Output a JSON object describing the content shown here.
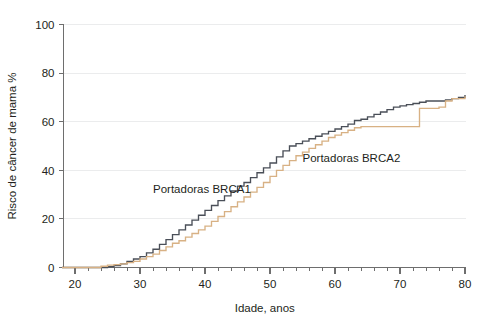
{
  "chart_data": {
    "type": "line",
    "title": "",
    "subtitle": "",
    "xlabel": "Idade, anos",
    "ylabel": "Risco de câncer de mama %",
    "xlim": [
      18,
      80
    ],
    "ylim": [
      0,
      100
    ],
    "grid": true,
    "grid_axis": "y",
    "legend_position": "inline-annotations",
    "step_style": "post",
    "x_ticks_major": [
      20,
      30,
      40,
      50,
      60,
      70,
      80
    ],
    "x_tick_labels": [
      "20",
      "30",
      "40",
      "50",
      "60",
      "70",
      "80"
    ],
    "x_ticks_minor_step": 2,
    "y_ticks_major": [
      0,
      20,
      40,
      60,
      80,
      100
    ],
    "y_tick_labels": [
      "0",
      "20",
      "40",
      "60",
      "80",
      "100"
    ],
    "annotations": [
      {
        "name": "brca1-label",
        "text": "Portadoras BRCA1",
        "x": 32.0,
        "y": 30.5
      },
      {
        "name": "brca2-label",
        "text": "Portadoras BRCA2",
        "x": 55.0,
        "y": 43.5
      }
    ],
    "series": [
      {
        "name": "Portadoras BRCA1",
        "color": "#4a4f58",
        "x": [
          18,
          20,
          22,
          24,
          25,
          26,
          27,
          28,
          29,
          30,
          31,
          32,
          33,
          34,
          35,
          36,
          37,
          38,
          39,
          40,
          41,
          42,
          43,
          44,
          45,
          46,
          47,
          48,
          49,
          50,
          51,
          52,
          53,
          54,
          55,
          56,
          57,
          58,
          59,
          60,
          61,
          62,
          63,
          64,
          65,
          66,
          67,
          68,
          69,
          70,
          71,
          72,
          73,
          74,
          75,
          76,
          77,
          78,
          79,
          80
        ],
        "values": [
          0,
          0,
          0,
          0,
          0.3,
          0.8,
          1.5,
          2.5,
          3.5,
          4.5,
          6.0,
          7.5,
          9.5,
          11.5,
          13.5,
          15.5,
          17.5,
          19.5,
          21.5,
          23.5,
          25.5,
          27.5,
          29.5,
          31.5,
          33.5,
          35.0,
          37.0,
          39.0,
          41.0,
          43.0,
          45.5,
          48.0,
          50.0,
          51.0,
          52.0,
          53.0,
          54.0,
          55.0,
          56.0,
          57.0,
          58.0,
          59.0,
          60.5,
          61.0,
          62.0,
          63.0,
          64.0,
          65.0,
          66.0,
          66.5,
          67.0,
          67.5,
          68.0,
          68.5,
          68.5,
          68.5,
          69.0,
          69.5,
          70.0,
          71.0
        ]
      },
      {
        "name": "Portadoras BRCA2",
        "color": "#d8b184",
        "x": [
          18,
          20,
          22,
          24,
          25,
          26,
          27,
          28,
          29,
          30,
          31,
          32,
          33,
          34,
          35,
          36,
          37,
          38,
          39,
          40,
          41,
          42,
          43,
          44,
          45,
          46,
          47,
          48,
          49,
          50,
          51,
          52,
          53,
          54,
          55,
          56,
          57,
          58,
          59,
          60,
          61,
          62,
          63,
          64,
          65,
          66,
          67,
          68,
          69,
          70,
          71,
          72,
          73,
          74,
          75,
          76,
          77,
          78,
          79,
          80
        ],
        "values": [
          0,
          0,
          0,
          0.5,
          1.0,
          1.2,
          1.5,
          2.0,
          2.5,
          3.5,
          4.5,
          5.5,
          7.0,
          8.5,
          10.0,
          11.0,
          12.5,
          14.0,
          15.5,
          17.0,
          19.0,
          21.0,
          23.0,
          25.0,
          27.0,
          29.0,
          31.0,
          33.0,
          35.0,
          37.5,
          40.0,
          42.0,
          44.0,
          46.0,
          47.5,
          49.0,
          50.5,
          52.0,
          53.5,
          54.5,
          55.5,
          56.5,
          57.5,
          58.0,
          58.0,
          58.0,
          58.0,
          58.0,
          58.0,
          58.0,
          58.0,
          58.0,
          65.5,
          65.5,
          65.5,
          66.0,
          68.5,
          69.5,
          69.5,
          70.5
        ]
      }
    ]
  }
}
